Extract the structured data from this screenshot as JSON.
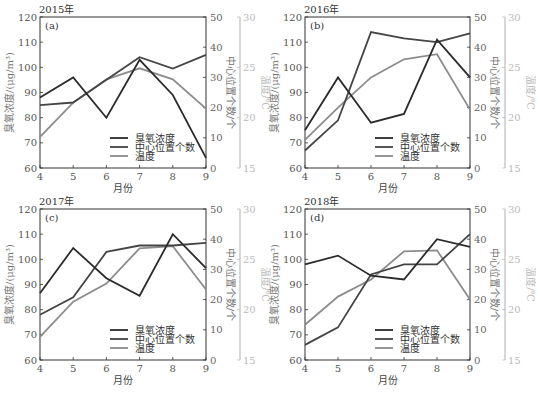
{
  "chart_data": [
    {
      "type": "line",
      "panel": "(a)",
      "title": "2015年",
      "xlabel": "月份",
      "ylabel": "臭氧浓度/(μg/m³)",
      "ylabel_right": "中心位置个数/个",
      "ylabel_right2": "温度/℃",
      "categories": [
        "4",
        "5",
        "6",
        "7",
        "8",
        "9"
      ],
      "ylim": [
        60,
        120
      ],
      "ylim_right": [
        0,
        50
      ],
      "ylim_right2": [
        15,
        30
      ],
      "series": [
        {
          "name": "臭氧浓度",
          "axis": "left",
          "values": [
            88,
            96,
            80,
            103,
            89,
            64
          ]
        },
        {
          "name": "中心位置个数",
          "axis": "right",
          "values": [
            20.8,
            21.7,
            29.2,
            36.7,
            32.9,
            37.5
          ]
        },
        {
          "name": "温度",
          "axis": "right2",
          "values": [
            18.1,
            21.5,
            23.8,
            24.9,
            23.8,
            20.9
          ]
        }
      ]
    },
    {
      "type": "line",
      "panel": "(b)",
      "title": "2016年",
      "xlabel": "月份",
      "ylabel": "臭氧浓度/(μg/m³)",
      "ylabel_right": "中心位置个数/个",
      "ylabel_right2": "温度/℃",
      "categories": [
        "4",
        "5",
        "6",
        "7",
        "8",
        "9"
      ],
      "ylim": [
        60,
        120
      ],
      "ylim_right": [
        0,
        50
      ],
      "ylim_right2": [
        15,
        30
      ],
      "series": [
        {
          "name": "臭氧浓度",
          "axis": "left",
          "values": [
            75,
            96,
            78,
            81.5,
            111,
            96
          ]
        },
        {
          "name": "中心位置个数",
          "axis": "right",
          "values": [
            5.8,
            15.8,
            45,
            42.9,
            41.7,
            44.6
          ]
        },
        {
          "name": "温度",
          "axis": "right2",
          "values": [
            17.8,
            21,
            24,
            25.8,
            26.3,
            20.8
          ]
        }
      ]
    },
    {
      "type": "line",
      "panel": "(c)",
      "title": "2017年",
      "xlabel": "月份",
      "ylabel": "臭氧浓度/(μg/m³)",
      "ylabel_right": "中心位置个数/个",
      "ylabel_right2": "温度/℃",
      "categories": [
        "4",
        "5",
        "6",
        "7",
        "8",
        "9"
      ],
      "ylim": [
        60,
        120
      ],
      "ylim_right": [
        0,
        50
      ],
      "ylim_right2": [
        15,
        30
      ],
      "series": [
        {
          "name": "臭氧浓度",
          "axis": "left",
          "values": [
            86.5,
            104.5,
            92.5,
            85.5,
            110,
            96.5
          ]
        },
        {
          "name": "中心位置个数",
          "axis": "right",
          "values": [
            15,
            20.8,
            35.8,
            37.9,
            37.9,
            38.8
          ]
        },
        {
          "name": "温度",
          "axis": "right2",
          "values": [
            17.3,
            20.8,
            22.6,
            26.1,
            26.3,
            22
          ]
        }
      ]
    },
    {
      "type": "line",
      "panel": "(d)",
      "title": "2018年",
      "xlabel": "月份",
      "ylabel": "臭氧浓度/(μg/m³)",
      "ylabel_right": "中心位置个数/个",
      "ylabel_right2": "温度/℃",
      "categories": [
        "4",
        "5",
        "6",
        "7",
        "8",
        "9"
      ],
      "ylim": [
        60,
        120
      ],
      "ylim_right": [
        0,
        50
      ],
      "ylim_right2": [
        15,
        30
      ],
      "series": [
        {
          "name": "臭氧浓度",
          "axis": "left",
          "values": [
            98,
            101.5,
            93.5,
            92,
            108,
            105
          ]
        },
        {
          "name": "中心位置个数",
          "axis": "right",
          "values": [
            5,
            10.8,
            28.3,
            31.7,
            31.7,
            41.7
          ]
        },
        {
          "name": "温度",
          "axis": "right2",
          "values": [
            18.5,
            21.3,
            23,
            25.8,
            25.9,
            21
          ]
        }
      ]
    }
  ],
  "axes": {
    "left_ticks": [
      "60",
      "70",
      "80",
      "90",
      "100",
      "110",
      "120"
    ],
    "right_ticks": [
      "0",
      "10",
      "20",
      "30",
      "40",
      "50"
    ],
    "temp_ticks": [
      "15",
      "20",
      "25",
      "30"
    ],
    "x_ticks": [
      "4",
      "5",
      "6",
      "7",
      "8",
      "9"
    ]
  },
  "legend": [
    "臭氧浓度",
    "中心位置个数",
    "温度"
  ],
  "colors": {
    "ozone": "#2b2b2b",
    "center": "#454545",
    "temperature": "#8c8c8c",
    "frame": "#333333",
    "temp_axis": "#bdbdbd"
  }
}
